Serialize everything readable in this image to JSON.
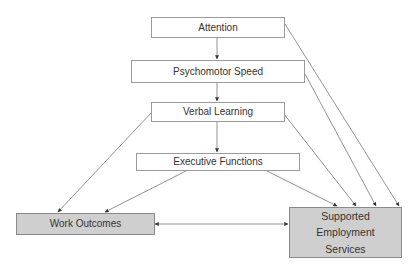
{
  "diagram": {
    "nodes": {
      "attention": {
        "label": "Attention"
      },
      "psychomotor": {
        "label": "Psychomotor Speed"
      },
      "verbal": {
        "label": "Verbal Learning"
      },
      "executive": {
        "label": "Executive Functions"
      },
      "work": {
        "label": "Work Outcomes"
      },
      "supported": {
        "line1": "Supported",
        "line2": "Employment",
        "line3": "Services"
      }
    },
    "edges": [
      {
        "from": "Attention",
        "to": "Psychomotor Speed"
      },
      {
        "from": "Psychomotor Speed",
        "to": "Verbal Learning"
      },
      {
        "from": "Verbal Learning",
        "to": "Executive Functions"
      },
      {
        "from": "Verbal Learning",
        "to": "Work Outcomes"
      },
      {
        "from": "Executive Functions",
        "to": "Work Outcomes"
      },
      {
        "from": "Attention",
        "to": "Supported Employment Services"
      },
      {
        "from": "Psychomotor Speed",
        "to": "Supported Employment Services"
      },
      {
        "from": "Verbal Learning",
        "to": "Supported Employment Services"
      },
      {
        "from": "Executive Functions",
        "to": "Supported Employment Services"
      },
      {
        "from": "Work Outcomes",
        "to": "Supported Employment Services",
        "bidirectional": true
      }
    ],
    "colors": {
      "shaded_box": "#cfcfcf",
      "line": "#777777",
      "border": "#9a9a9a"
    }
  }
}
